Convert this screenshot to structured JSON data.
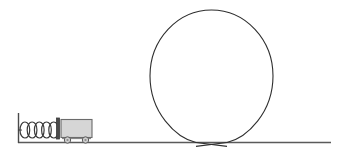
{
  "diagram": {
    "background_color": "#ffffff",
    "canvas": {
      "width": 341,
      "height": 157
    },
    "line_color": "#3a3a3a",
    "cart_fill_color": "#d6d6d6",
    "ground": {
      "label": "ground-track",
      "y": 142.5,
      "x_start": 18,
      "x_end": 331,
      "color": "#5a5a5a"
    },
    "wall": {
      "label": "left-wall",
      "x": 18.5,
      "y_top": 113,
      "y_bottom": 143,
      "color": "#4a4a4a"
    },
    "spring": {
      "label": "compressed-spring",
      "coil_count": 5,
      "x_start": 20,
      "x_end": 56,
      "center_y": 130,
      "coil_radius_x": 4.2,
      "coil_radius_y": 10.5,
      "color": "#3a3a3a"
    },
    "cart": {
      "label": "cart",
      "body": {
        "x": 61,
        "y": 119.5,
        "width": 31,
        "height": 18
      },
      "end_plate": {
        "x": 56.5,
        "y": 118,
        "width": 3,
        "height": 21
      },
      "wheels": [
        {
          "cx": 67.5,
          "cy": 140,
          "r": 3.2
        },
        {
          "cx": 85.5,
          "cy": 140,
          "r": 3.2
        }
      ],
      "fill": "#d6d6d6",
      "stroke": "#6b6b6b"
    },
    "loop": {
      "label": "vertical-loop",
      "center_x": 211.5,
      "center_y": 76,
      "radius_x": 61.5,
      "radius_y": 66,
      "crossing_x": 211.5,
      "crossing_y": 142.5,
      "color": "#2e2e2e"
    }
  }
}
